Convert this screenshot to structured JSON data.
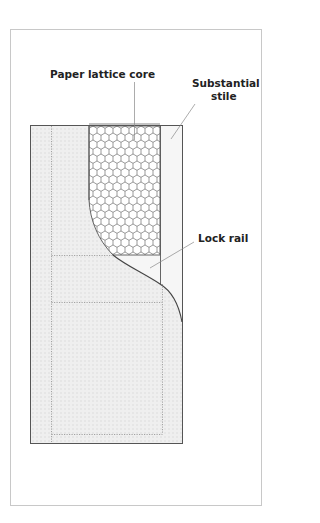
{
  "diagram": {
    "labels": {
      "core": "Paper lattice core",
      "stile_line1": "Substantial",
      "stile_line2": "stile",
      "lock_rail": "Lock rail"
    },
    "colors": {
      "frame_border": "#c8c8c8",
      "door_outline": "#555555",
      "door_fill": "#eeeeee",
      "grid_tint": "#e4e4e4",
      "hex_stroke": "#555555",
      "dotted": "#9a9a9a",
      "leader": "#888888",
      "text": "#222222"
    }
  }
}
